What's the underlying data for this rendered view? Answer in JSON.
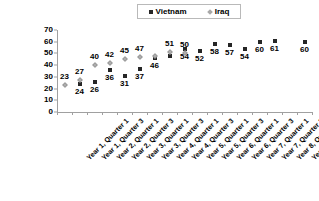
{
  "chart_data": {
    "type": "scatter",
    "title": "",
    "xlabel": "",
    "ylabel": "",
    "ylim": [
      0,
      70
    ],
    "yticks": [
      0,
      10,
      20,
      30,
      40,
      50,
      60,
      70
    ],
    "grid": false,
    "legend_position": "top-center",
    "categories": [
      "Year 1, Quarter 1",
      "Year 1, Quarter 3",
      "Year 2, Quarter 1",
      "Year 2, Quarter 3",
      "Year 3, Quarter 1",
      "Year 3, Quarter 3",
      "Year 4, Quarter 1",
      "Year 4, Quarter 3",
      "Year 5, Quarter 1",
      "Year 5, Quarter 3",
      "Year 6, Quarter 1",
      "Year 6, Quarter 3",
      "Year 7, Quarter 1",
      "Year 7, Quarter 3",
      "Year 8, Quarter 1",
      "Year 8, Quarter 3",
      "Year 9, Quarter 1"
    ],
    "series": [
      {
        "name": "Vietnam",
        "marker": "square",
        "color": "#262626",
        "values": [
          null,
          24,
          26,
          36,
          31,
          37,
          46,
          48,
          54,
          52,
          58,
          57,
          54,
          60,
          61,
          null,
          60
        ],
        "labels": [
          null,
          "24",
          "26",
          "36",
          "31",
          "37",
          "46",
          null,
          "54",
          "52",
          "58",
          "57",
          "54",
          "60",
          "61",
          null,
          "60"
        ]
      },
      {
        "name": "Iraq",
        "marker": "diamond",
        "color": "#b0b0b0",
        "values": [
          23,
          27,
          40,
          42,
          45,
          47,
          48,
          51,
          50,
          null,
          null,
          null,
          null,
          null,
          null,
          null,
          null
        ],
        "labels": [
          "23",
          "27",
          "40",
          "42",
          "45",
          "47",
          null,
          "51",
          "50",
          null,
          null,
          null,
          null,
          null,
          null,
          null,
          null
        ]
      }
    ]
  },
  "legend": {
    "items": [
      {
        "label": "Vietnam",
        "marker": "square"
      },
      {
        "label": "Iraq",
        "marker": "diamond"
      }
    ]
  }
}
